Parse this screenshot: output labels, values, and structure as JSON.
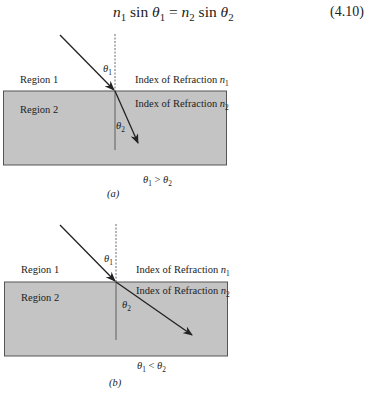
{
  "equation": {
    "n1": "n",
    "n1_sub": "1",
    "sin1": " sin ",
    "theta1": "θ",
    "theta1_sub": "1",
    "equals": " = ",
    "n2": "n",
    "n2_sub": "2",
    "sin2": " sin ",
    "theta2": "θ",
    "theta2_sub": "2",
    "number": "(4.10)"
  },
  "figures": [
    {
      "id": "a",
      "region1": "Region 1",
      "region2": "Region 2",
      "index1_text": "Index of Refraction ",
      "index1_var": "n",
      "index1_sub": "1",
      "index2_text": "Index of Refraction ",
      "index2_var": "n",
      "index2_sub": "2",
      "theta1": "θ",
      "theta1_sub": "1",
      "theta2": "θ",
      "theta2_sub": "2",
      "relation_left": "θ",
      "relation_left_sub": "1",
      "relation_op": " > ",
      "relation_right": "θ",
      "relation_right_sub": "2",
      "caption": "(a)"
    },
    {
      "id": "b",
      "region1": "Region 1",
      "region2": "Region 2",
      "index1_text": "Index of Refraction ",
      "index1_var": "n",
      "index1_sub": "1",
      "index2_text": "Index of Refraction ",
      "index2_var": "n",
      "index2_sub": "2",
      "theta1": "θ",
      "theta1_sub": "1",
      "theta2": "θ",
      "theta2_sub": "2",
      "relation_left": "θ",
      "relation_left_sub": "1",
      "relation_op": " < ",
      "relation_right": "θ",
      "relation_right_sub": "2",
      "caption": "(b)"
    }
  ],
  "colors": {
    "medium_fill": "#c4c4c4",
    "line": "#222222"
  }
}
